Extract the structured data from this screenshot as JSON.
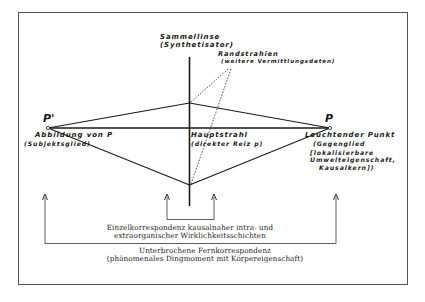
{
  "lens": {
    "title": "Sammellinse",
    "subtitle": "(Synthetisator)"
  },
  "edge_rays": {
    "title": "Randstrahien",
    "subtitle": "(weitere Vermittlungsdaten)"
  },
  "image_point": {
    "symbol": "P'",
    "title": "Abbildung von P",
    "subtitle": "(Subjektsglied)"
  },
  "main_ray": {
    "title": "Hauptstrahl",
    "subtitle": "(direkter Reiz p)"
  },
  "object_point": {
    "symbol": "P",
    "title": "Leuchtender Punkt",
    "line2": "(Gegenglied",
    "line3": "[lokalisierbare",
    "line4": "Umwelteigenschaft,",
    "line5": "Kausalkern])"
  },
  "inner_correspondence": {
    "line1": "Einzelkorrespondenz kausalnaher intra- und",
    "line2": "extraorganischer Wirklichkeitsschichten"
  },
  "outer_correspondence": {
    "line1": "Unterbrochene Fernkorrespondenz",
    "line2": "(phänomenales Dingmoment mit Körpereigenschaft)"
  },
  "colors": {
    "ink": "#1a1a1a",
    "frame": "#555555",
    "background": "#ffffff"
  }
}
